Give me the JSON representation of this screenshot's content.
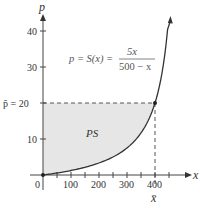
{
  "chart_data": {
    "type": "area",
    "title": "",
    "xlabel": "x",
    "ylabel": "p",
    "x_ticks": [
      0,
      100,
      200,
      300,
      400
    ],
    "x_tick_labels": [
      "0",
      "100",
      "200",
      "300",
      "400"
    ],
    "x_minor_tick_step": 50,
    "y_ticks": [
      10,
      20,
      30,
      40
    ],
    "y_tick_labels": [
      "10",
      "20",
      "30",
      "40"
    ],
    "xlim": [
      0,
      490
    ],
    "ylim": [
      0,
      45
    ],
    "grid": false,
    "curve": {
      "name": "p = S(x) = 5x / (500 - x)",
      "equation_lhs": "p = S(x) =",
      "numerator": "5x",
      "denominator": "500 − x",
      "x": [
        0,
        50,
        100,
        150,
        200,
        250,
        300,
        350,
        400,
        430,
        450
      ],
      "y": [
        0,
        0.56,
        1.25,
        2.14,
        3.33,
        5.0,
        7.5,
        11.67,
        20.0,
        30.71,
        45.0
      ]
    },
    "equilibrium_point": {
      "x": 400,
      "y": 20
    },
    "p_bar_label": "p̄ = 20",
    "x_bar_label": "x̄",
    "shaded_region": {
      "label": "PS",
      "description": "Producers' surplus: area between p = 20 and the supply curve from x = 0 to x = 400",
      "fill_color": "#e6e6e6"
    },
    "origin_label": "0",
    "colors": {
      "axis": "#444444",
      "curve": "#333333",
      "dashed": "#555555",
      "shade": "#e6e6e6"
    }
  }
}
